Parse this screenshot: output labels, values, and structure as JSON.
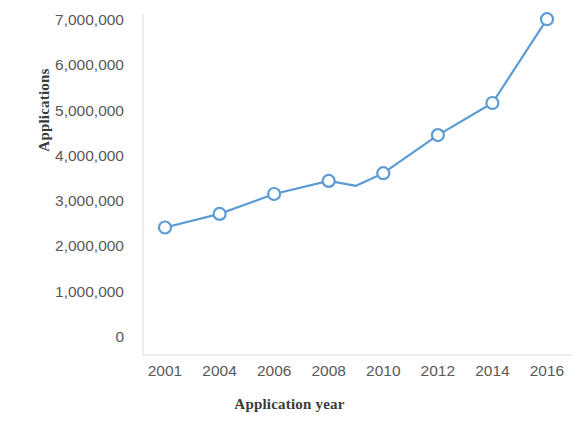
{
  "chart_data": {
    "type": "line",
    "title": "",
    "subtitle": "",
    "xlabel": "Application year",
    "ylabel": "Applications",
    "categories": [
      "2001",
      "2004",
      "2006",
      "2008",
      "2010",
      "2012",
      "2014",
      "2016"
    ],
    "x_tick_labels": [
      "2001",
      "2004",
      "2006",
      "2008",
      "2010",
      "2012",
      "2014",
      "2016"
    ],
    "y_tick_labels": [
      "7,000,000",
      "6,000,000",
      "5,000,000",
      "4,000,000",
      "3,000,000",
      "2,000,000",
      "1,000,000",
      "0"
    ],
    "y_tick_values": [
      7000000,
      6000000,
      5000000,
      4000000,
      3000000,
      2000000,
      1000000,
      0
    ],
    "ylim": [
      0,
      7000000
    ],
    "grid": false,
    "legend": false,
    "legend_position": "none",
    "series": [
      {
        "name": "Applications",
        "color": "#5B9BD5",
        "marker": "open-circle",
        "points": [
          {
            "x": "2001",
            "y": 2440000,
            "marker": true
          },
          {
            "x": "2004",
            "y": 2740000,
            "marker": true
          },
          {
            "x": "2006",
            "y": 3180000,
            "marker": true
          },
          {
            "x": "2008",
            "y": 3470000,
            "marker": true
          },
          {
            "x": "2009",
            "y": 3360000,
            "marker": false
          },
          {
            "x": "2010",
            "y": 3640000,
            "marker": true
          },
          {
            "x": "2012",
            "y": 4480000,
            "marker": true
          },
          {
            "x": "2014",
            "y": 5190000,
            "marker": true
          },
          {
            "x": "2016",
            "y": 7040000,
            "marker": true
          }
        ],
        "values": [
          2440000,
          2740000,
          3180000,
          3470000,
          3640000,
          4480000,
          5190000,
          7040000
        ]
      }
    ],
    "axis_line_color": "#d9d9d9",
    "tick_label_color": "#595959",
    "axis_title_color": "#3b3b3b"
  }
}
